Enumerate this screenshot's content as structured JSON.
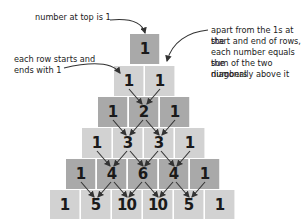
{
  "annotations": {
    "top": "number at top is 1",
    "edges_line1": "each row starts and",
    "edges_line2": "ends with  1",
    "sum_line1": "apart from the 1s at the",
    "sum_line2": "start and end of rows,",
    "sum_line3": "each number equals the",
    "sum_line4": "sum of the two numbers",
    "sum_line5": "diagonally above it"
  },
  "rows": [
    [
      "1"
    ],
    [
      "1",
      "1"
    ],
    [
      "1",
      "2",
      "1"
    ],
    [
      "1",
      "3",
      "3",
      "1"
    ],
    [
      "1",
      "4",
      "6",
      "4",
      "1"
    ],
    [
      "1",
      "5",
      "10",
      "10",
      "5",
      "1"
    ]
  ],
  "colors": {
    "dark_block": "#a9a9a9",
    "light_block": "#d2d2d2",
    "text": "#1a1a1a"
  }
}
